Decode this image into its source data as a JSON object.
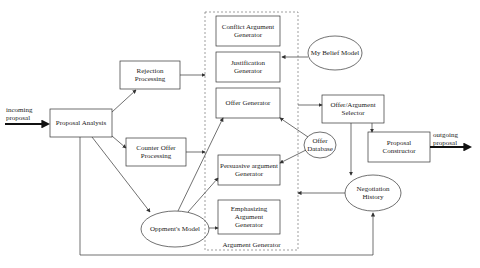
{
  "diagram": {
    "group": {
      "label": "Argument Generator"
    },
    "inputs": {
      "incoming": "incoming proposal",
      "incoming_l1": "incoming",
      "incoming_l2": "proposal"
    },
    "outputs": {
      "outgoing_l1": "outgoing",
      "outgoing_l2": "proposal"
    },
    "nodes": {
      "proposal_analysis": "Proposal Analysis",
      "rejection_l1": "Rejection",
      "rejection_l2": "Processing",
      "counter_l1": "Counter Offer",
      "counter_l2": "Processing",
      "conflict_l1": "Conflict Argument",
      "conflict_l2": "Generator",
      "justification_l1": "Justification",
      "justification_l2": "Generator",
      "offer_gen": "Offer Generator",
      "persuasive_l1": "Persuasive argument",
      "persuasive_l2": "Generator",
      "emph_l1": "Emphasizing",
      "emph_l2": "Argument",
      "emph_l3": "Generator",
      "belief": "My Belief Model",
      "offer_db_l1": "Offer",
      "offer_db_l2": "Database",
      "selector_l1": "Offer/Argument",
      "selector_l2": "Selector",
      "constructor_l1": "Proposal",
      "constructor_l2": "Constructor",
      "history_l1": "Negotiation",
      "history_l2": "History",
      "opponent": "Oppment's Model"
    },
    "colors": {
      "line": "#333333",
      "dashed": "#777777",
      "background": "#ffffff"
    }
  }
}
